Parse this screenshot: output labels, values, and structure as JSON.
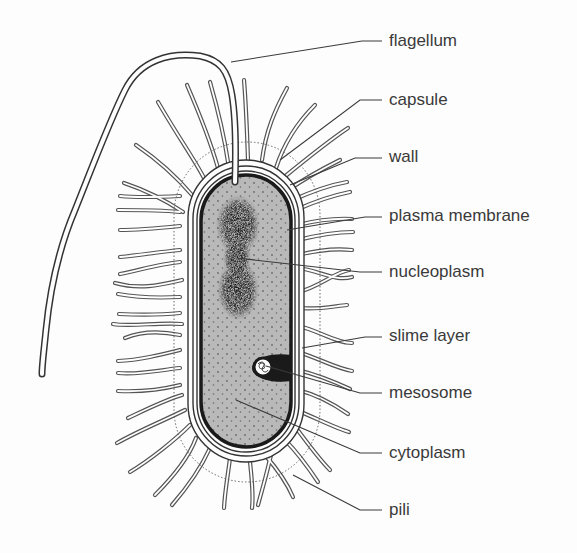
{
  "diagram": {
    "colors": {
      "background": "#fdfdfd",
      "line": "#3a3a3a",
      "cytoplasm": "#b8b8b8",
      "nucleoplasm": "#1a1a1a",
      "pili_fill": "#ffffff"
    },
    "labels": [
      {
        "id": "flagellum",
        "text": "flagellum",
        "x": 389,
        "y": 31,
        "leader": [
          [
            231,
            62
          ],
          [
            362,
            41
          ],
          [
            382,
            41
          ]
        ]
      },
      {
        "id": "capsule",
        "text": "capsule",
        "x": 389,
        "y": 90,
        "leader": [
          [
            280,
            160
          ],
          [
            360,
            100
          ],
          [
            382,
            100
          ]
        ]
      },
      {
        "id": "wall",
        "text": "wall",
        "x": 389,
        "y": 147,
        "leader": [
          [
            290,
            185
          ],
          [
            355,
            158
          ],
          [
            382,
            158
          ]
        ]
      },
      {
        "id": "plasma-membrane",
        "text": "plasma membrane",
        "x": 389,
        "y": 206,
        "leader": [
          [
            287,
            230
          ],
          [
            365,
            217
          ],
          [
            382,
            217
          ]
        ]
      },
      {
        "id": "nucleoplasm",
        "text": "nucleoplasm",
        "x": 389,
        "y": 262,
        "leader": [
          [
            237,
            258
          ],
          [
            360,
            272
          ],
          [
            382,
            272
          ]
        ]
      },
      {
        "id": "slime-layer",
        "text": "slime layer",
        "x": 389,
        "y": 326,
        "leader": [
          [
            302,
            348
          ],
          [
            365,
            337
          ],
          [
            382,
            337
          ]
        ]
      },
      {
        "id": "mesosome",
        "text": "mesosome",
        "x": 389,
        "y": 383,
        "leader": [
          [
            266,
            366
          ],
          [
            360,
            393
          ],
          [
            382,
            393
          ]
        ]
      },
      {
        "id": "cytoplasm",
        "text": "cytoplasm",
        "x": 389,
        "y": 443,
        "leader": [
          [
            236,
            400
          ],
          [
            360,
            453
          ],
          [
            382,
            453
          ]
        ]
      },
      {
        "id": "pili",
        "text": "pili",
        "x": 389,
        "y": 500,
        "leader": [
          [
            293,
            475
          ],
          [
            360,
            510
          ],
          [
            382,
            510
          ]
        ]
      }
    ]
  }
}
